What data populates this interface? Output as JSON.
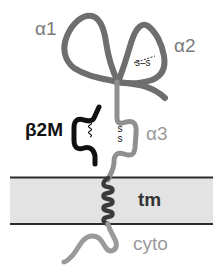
{
  "diagram": {
    "labels": {
      "alpha1": "α1",
      "alpha2": "α2",
      "alpha3": "α3",
      "beta2m": "β2M",
      "tm": "tm",
      "cyto": "cyto",
      "disulfide_alpha2": "s–s",
      "disulfide_alpha3_top": "s",
      "disulfide_alpha3_bottom": "s"
    },
    "colors": {
      "heavy_chain": "#7a7a7a",
      "alpha3_chain": "#8f8f8f",
      "beta2m_chain": "#111111",
      "tm_helix": "#3a3a3a",
      "membrane_fill": "#e3e3e3",
      "membrane_border": "#2b2b2b",
      "label_gray": "#7a7a7a",
      "label_dark": "#111111"
    },
    "regions": [
      "α1",
      "α2",
      "α3",
      "β2M",
      "tm",
      "cyto"
    ]
  }
}
